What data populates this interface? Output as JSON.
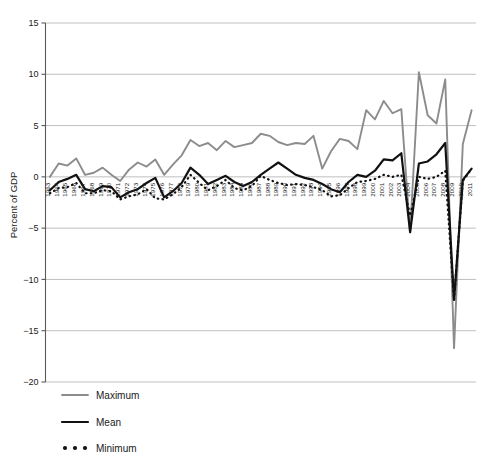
{
  "chart_data": {
    "type": "line",
    "title": "",
    "xlabel": "",
    "ylabel": "Percent of GDP",
    "ylim": [
      -20,
      15
    ],
    "yticks": [
      15,
      10,
      5,
      0,
      -5,
      -10,
      -15,
      -20
    ],
    "ytick_labels": [
      "15",
      "10",
      "5",
      "0",
      "−5",
      "−10",
      "−15",
      "−20"
    ],
    "grid": true,
    "legend_position": "below-left",
    "categories": [
      "1963",
      "1964",
      "1965",
      "1966",
      "1967",
      "1968",
      "1969",
      "1970",
      "1971",
      "1972",
      "1973",
      "1974",
      "1975",
      "1976",
      "1977",
      "1978",
      "1979",
      "1980",
      "1981",
      "1982",
      "1983",
      "1984",
      "1985",
      "1986",
      "1987",
      "1988",
      "1989",
      "1990",
      "1991",
      "1992",
      "1993",
      "1994",
      "1995",
      "1996",
      "1997",
      "1998",
      "1999",
      "2000",
      "2001",
      "2002",
      "2003",
      "2004",
      "2005",
      "2006",
      "2007",
      "2008",
      "2009",
      "2010",
      "2011"
    ],
    "series": [
      {
        "name": "Maximum",
        "color": "#8c8c8c",
        "style": "solid",
        "values": [
          0.0,
          1.3,
          1.1,
          1.8,
          0.2,
          0.4,
          0.9,
          0.2,
          -0.4,
          0.7,
          1.4,
          1.0,
          1.7,
          0.2,
          1.2,
          2.1,
          3.6,
          3.0,
          3.3,
          2.6,
          3.5,
          2.9,
          3.1,
          3.3,
          4.2,
          4.0,
          3.4,
          3.1,
          3.3,
          3.2,
          4.0,
          0.8,
          2.5,
          3.7,
          3.5,
          2.7,
          6.5,
          5.6,
          7.4,
          6.2,
          6.6,
          -5.4,
          10.2,
          6.0,
          5.2,
          9.5,
          -16.7,
          3.2,
          6.5
        ]
      },
      {
        "name": "Mean",
        "color": "#111111",
        "style": "solid",
        "values": [
          -1.3,
          -0.5,
          -0.2,
          0.2,
          -1.2,
          -1.4,
          -0.9,
          -1.0,
          -2.0,
          -1.5,
          -1.2,
          -0.6,
          -0.1,
          -2.0,
          -1.4,
          -0.6,
          0.9,
          0.2,
          -0.7,
          -0.3,
          0.1,
          -0.5,
          -0.9,
          -0.5,
          0.2,
          0.8,
          1.4,
          0.8,
          0.2,
          -0.1,
          -0.3,
          -0.7,
          -1.2,
          -1.5,
          -0.5,
          0.2,
          0.0,
          0.6,
          1.7,
          1.6,
          2.3,
          -5.4,
          1.3,
          1.5,
          2.2,
          3.3,
          -12.0,
          -0.3,
          0.8
        ]
      },
      {
        "name": "Minimum",
        "color": "#111111",
        "style": "dotted",
        "values": [
          -1.6,
          -1.1,
          -1.0,
          -0.6,
          -1.6,
          -1.6,
          -1.3,
          -1.4,
          -2.2,
          -1.9,
          -1.7,
          -1.2,
          -2.1,
          -2.2,
          -1.7,
          -1.0,
          0.2,
          -0.6,
          -1.3,
          -0.9,
          -0.3,
          -1.1,
          -1.3,
          -0.9,
          0.1,
          -0.3,
          -0.6,
          -0.8,
          -0.7,
          -0.8,
          -1.0,
          -1.3,
          -1.9,
          -1.8,
          -1.1,
          -0.5,
          -0.4,
          -0.2,
          0.2,
          0.0,
          0.2,
          -3.8,
          0.0,
          -0.2,
          0.0,
          0.6,
          -12.0,
          -0.4,
          0.8
        ]
      }
    ],
    "legend": [
      {
        "label": "Maximum",
        "swatch": "line-gray"
      },
      {
        "label": "Mean",
        "swatch": "line-black"
      },
      {
        "label": "Minimum",
        "swatch": "dots-black"
      }
    ],
    "colors": {
      "maximum": "#8c8c8c",
      "mean": "#111111",
      "minimum": "#111111",
      "gridline": "#b9b9b9",
      "axis": "#5a5a5a",
      "background": "#ffffff"
    }
  }
}
